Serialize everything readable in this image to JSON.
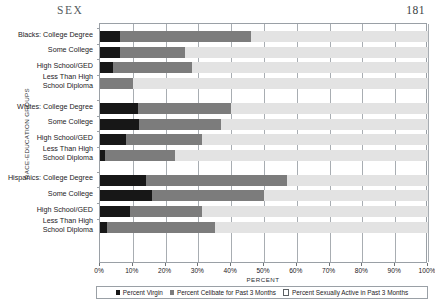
{
  "page": {
    "running_title": "SEX",
    "folio": "181"
  },
  "chart_data": {
    "type": "bar",
    "subtype": "stacked-horizontal-100",
    "title": "",
    "xlabel": "PERCENT",
    "ylabel": "RACE-EDUCATION GROUPS",
    "xlim": [
      0,
      100
    ],
    "xticks": [
      0,
      10,
      20,
      30,
      40,
      50,
      60,
      70,
      80,
      90,
      100
    ],
    "xticklabels": [
      "0%",
      "10%",
      "20%",
      "30%",
      "40%",
      "50%",
      "60%",
      "70%",
      "80%",
      "90%",
      "100%"
    ],
    "grid": "vertical",
    "legend_position": "bottom",
    "legend": [
      {
        "label": "Percent Virgin",
        "color": "#171717",
        "key": "virgin"
      },
      {
        "label": "Percent Celibate for Past 3 Months",
        "color": "#7c7c7c",
        "key": "celibate"
      },
      {
        "label": "Percent Sexually Active in Past 3 Months",
        "color": "#e3e3e3",
        "key": "active"
      }
    ],
    "categories": [
      "Blacks:  College Degree",
      "Some College",
      "High School/GED",
      "Less Than High\nSchool Diploma",
      "Whites:  College Degree",
      "Some College",
      "High School/GED",
      "Less Than High\nSchool Diploma",
      "Hispanics:  College Degree",
      "Some College",
      "High School/GED",
      "Less Than High\nSchool Diploma"
    ],
    "series": [
      {
        "name": "Percent Virgin",
        "values": [
          6,
          6,
          4,
          0,
          11.5,
          12,
          8,
          1.5,
          14,
          16,
          9,
          2
        ]
      },
      {
        "name": "Percent Celibate for Past 3 Months",
        "values": [
          40,
          20,
          24,
          10,
          28.5,
          25,
          23,
          21.5,
          43,
          34,
          22,
          33
        ]
      },
      {
        "name": "Percent Sexually Active in Past 3 Months",
        "values": [
          54,
          74,
          72,
          90,
          60,
          63,
          69,
          77,
          43,
          50,
          69,
          65
        ]
      }
    ],
    "groups": [
      {
        "name": "Blacks",
        "rows": [
          0,
          1,
          2,
          3
        ]
      },
      {
        "name": "Whites",
        "rows": [
          4,
          5,
          6,
          7
        ]
      },
      {
        "name": "Hispanics",
        "rows": [
          8,
          9,
          10,
          11
        ]
      }
    ]
  }
}
